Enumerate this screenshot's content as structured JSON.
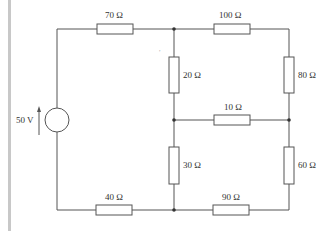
{
  "diagram": {
    "type": "circuit",
    "source": {
      "label": "50 V",
      "type": "voltage-source"
    },
    "resistors": [
      {
        "id": "r70",
        "label": "70 Ω"
      },
      {
        "id": "r100",
        "label": "100 Ω"
      },
      {
        "id": "r20",
        "label": "20 Ω"
      },
      {
        "id": "r80",
        "label": "80 Ω"
      },
      {
        "id": "r10",
        "label": "10 Ω"
      },
      {
        "id": "r30",
        "label": "30 Ω"
      },
      {
        "id": "r60",
        "label": "60 Ω"
      },
      {
        "id": "r40",
        "label": "40 Ω"
      },
      {
        "id": "r90",
        "label": "90 Ω"
      }
    ],
    "colors": {
      "wire": "#555555",
      "bar": "#c8c8c8"
    }
  }
}
